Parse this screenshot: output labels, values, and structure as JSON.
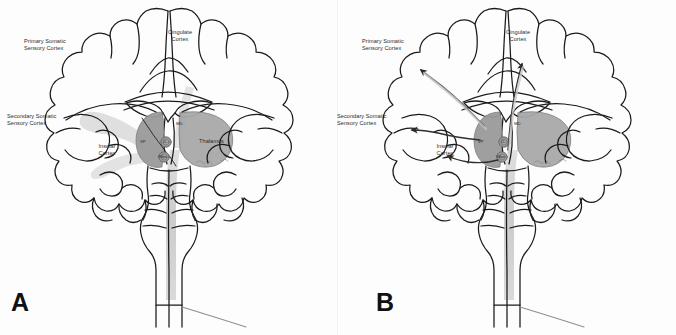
{
  "figure": {
    "type": "anatomical-diagram",
    "panels": [
      {
        "id": "A",
        "plate_label": "A",
        "labels": [
          {
            "name": "primary-somatic-sensory-cortex",
            "text": "Primary Somatic\nSensory Cortex"
          },
          {
            "name": "cingulate-cortex",
            "text": "Cingulate\nCortex"
          },
          {
            "name": "secondary-somatic-sensory-cortex",
            "text": "Secondary Somatic\nSensory Cortex"
          },
          {
            "name": "insular-cortex",
            "text": "Insular\nCortex"
          },
          {
            "name": "thalamus",
            "text": "Thalamus"
          }
        ],
        "nuclei": [
          {
            "name": "md-nucleus",
            "text": "MD"
          },
          {
            "name": "vp-nucleus",
            "text": "VP"
          },
          {
            "name": "cl-nucleus",
            "text": "CL"
          },
          {
            "name": "vmpo-nucleus",
            "text": "VMpo"
          }
        ]
      },
      {
        "id": "B",
        "plate_label": "B",
        "labels": [
          {
            "name": "primary-somatic-sensory-cortex",
            "text": "Primary Somatic\nSensory Cortex"
          },
          {
            "name": "cingulate-cortex",
            "text": "Cingulate\nCortex"
          },
          {
            "name": "secondary-somatic-sensory-cortex",
            "text": "Secondary Somatic\nSensory Cortex"
          },
          {
            "name": "insular-cortex",
            "text": "Insular\nCortex"
          }
        ],
        "nuclei": [
          {
            "name": "md-nucleus",
            "text": "MD"
          },
          {
            "name": "vp-nucleus",
            "text": "VP"
          },
          {
            "name": "cl-nucleus",
            "text": "CL"
          },
          {
            "name": "vmpo-nucleus",
            "text": "VMpo"
          }
        ]
      }
    ],
    "colors": {
      "background": "#fdfdfd",
      "outline": "#1a1a1a",
      "thalamus_fill": "#a9a9a9",
      "nuclei_fill": "#9b9b9b",
      "pathway_faint": "#cfcfcf",
      "pathway_dark": "#3a3a3a",
      "label_text": "#2b2b2b",
      "plate_text": "#111111"
    }
  }
}
